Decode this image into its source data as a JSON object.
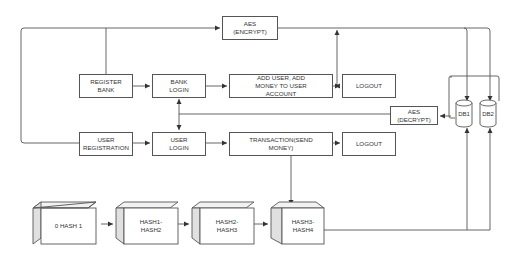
{
  "diagram": {
    "nodes": {
      "aes_encrypt": "AES\n(ENCRYPT)",
      "register_bank": "REGISTER\nBANK",
      "bank_login": "BANK\nLOGIN",
      "add_user": "ADD USER, ADD\nMONEY TO USER\nACCOUNT",
      "logout_top": "LOGOUT",
      "aes_decrypt": "AES\n(DECRYPT)",
      "db1": "DB1",
      "db2": "DB2",
      "user_registration": "USER\nREGISTRATION",
      "user_login": "USER\nLOGIN",
      "transaction": "TRANSACTION(SEND\nMONEY)",
      "logout_bottom": "LOGOUT",
      "hash0": "0 HASH 1",
      "hash12": "HASH1-\nHASH2",
      "hash23": "HASH2-\nHASH3",
      "hash34": "HASH3-\nHASH4"
    },
    "edges": [
      {
        "from": "register_bank",
        "to": "bank_login"
      },
      {
        "from": "bank_login",
        "to": "add_user"
      },
      {
        "from": "add_user",
        "to": "logout_top"
      },
      {
        "from": "register_bank",
        "to": "aes_encrypt"
      },
      {
        "from": "user_registration",
        "to": "aes_encrypt"
      },
      {
        "from": "aes_encrypt",
        "to": "db1"
      },
      {
        "from": "aes_encrypt",
        "to": "db2"
      },
      {
        "from": "add_user",
        "to": "aes_encrypt"
      },
      {
        "from": "db1",
        "to": "aes_decrypt"
      },
      {
        "from": "aes_decrypt",
        "to": "bank_login"
      },
      {
        "from": "aes_decrypt",
        "to": "user_login"
      },
      {
        "from": "user_registration",
        "to": "user_login"
      },
      {
        "from": "user_login",
        "to": "transaction"
      },
      {
        "from": "transaction",
        "to": "logout_bottom"
      },
      {
        "from": "transaction",
        "to": "hash34"
      },
      {
        "from": "hash0",
        "to": "hash12"
      },
      {
        "from": "hash12",
        "to": "hash23"
      },
      {
        "from": "hash23",
        "to": "hash34"
      },
      {
        "from": "hash34",
        "to": "db1"
      },
      {
        "from": "hash34",
        "to": "db2"
      }
    ]
  }
}
